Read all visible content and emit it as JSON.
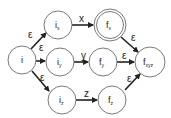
{
  "diagram": {
    "type": "nfa",
    "colors": {
      "stroke": "#6a6a6a",
      "edge": "#222222",
      "background": "#ffffff"
    },
    "nodes": [
      {
        "id": "i",
        "label": "i",
        "sub": "",
        "cx": 22,
        "cy": 60,
        "r": 14,
        "accepting": false
      },
      {
        "id": "ix",
        "label": "i",
        "sub": "x",
        "cx": 58,
        "cy": 25,
        "r": 14,
        "accepting": false
      },
      {
        "id": "iy",
        "label": "i",
        "sub": "y",
        "cx": 60,
        "cy": 62,
        "r": 14,
        "accepting": false
      },
      {
        "id": "iz",
        "label": "i",
        "sub": "z",
        "cx": 62,
        "cy": 100,
        "r": 14,
        "accepting": false
      },
      {
        "id": "fx",
        "label": "f",
        "sub": "x",
        "cx": 110,
        "cy": 25,
        "r": 14,
        "accepting": true
      },
      {
        "id": "fy",
        "label": "f",
        "sub": "y",
        "cx": 103,
        "cy": 62,
        "r": 14,
        "accepting": false
      },
      {
        "id": "fz",
        "label": "f",
        "sub": "z",
        "cx": 112,
        "cy": 100,
        "r": 14,
        "accepting": false
      },
      {
        "id": "fxyz",
        "label": "f",
        "sub": "xyz",
        "cx": 150,
        "cy": 62,
        "r": 15,
        "accepting": false
      }
    ],
    "edges": [
      {
        "from": "i",
        "to": "ix",
        "label": "ε"
      },
      {
        "from": "i",
        "to": "iy",
        "label": "ε"
      },
      {
        "from": "i",
        "to": "iz",
        "label": "ε"
      },
      {
        "from": "ix",
        "to": "fx",
        "label": "x"
      },
      {
        "from": "iy",
        "to": "fy",
        "label": "y"
      },
      {
        "from": "iz",
        "to": "fz",
        "label": "z"
      },
      {
        "from": "fx",
        "to": "fxyz",
        "label": "ε"
      },
      {
        "from": "fy",
        "to": "fxyz",
        "label": "ε"
      },
      {
        "from": "fz",
        "to": "fxyz",
        "label": "ε"
      }
    ]
  }
}
